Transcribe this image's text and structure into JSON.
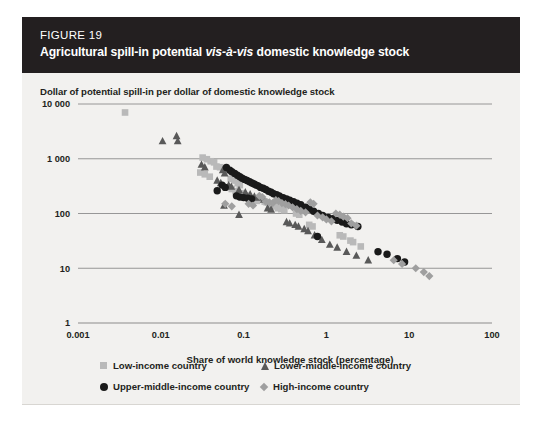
{
  "figure": {
    "number_label": "FIGURE 19",
    "title_part1": "Agricultural spill-in potential ",
    "title_italic": "vis-à-vis",
    "title_part2": " domestic knowledge stock",
    "title_full": "Agricultural spill-in potential vis-à-vis domestic knowledge stock"
  },
  "colors": {
    "header_background": "#231f20",
    "card_background": "#f2f1ef",
    "page_background": "#ffffff",
    "axis_line": "#8c8c8c",
    "gridline": "#8c8c8c",
    "text": "#231f20",
    "low_income": "#b9b9b9",
    "lower_middle_income": "#595959",
    "upper_middle_income": "#1a1a1a",
    "high_income": "#9f9f9f"
  },
  "legend": {
    "position": "below-plot",
    "items": [
      {
        "label": "Low-income country",
        "marker": "square",
        "color": "#b9b9b9",
        "icon": "square-marker-icon"
      },
      {
        "label": "Lower-middle-income country",
        "marker": "triangle",
        "color": "#595959",
        "icon": "triangle-marker-icon"
      },
      {
        "label": "Upper-middle-income country",
        "marker": "circle",
        "color": "#1a1a1a",
        "icon": "circle-marker-icon"
      },
      {
        "label": "High-income country",
        "marker": "diamond",
        "color": "#9f9f9f",
        "icon": "diamond-marker-icon"
      }
    ]
  },
  "chart_data": {
    "type": "scatter",
    "title": "Agricultural spill-in potential vis-à-vis domestic knowledge stock",
    "xlabel": "Share of world knowledge stock (percentage)",
    "ylabel": "Dollar of potential spill-in per dollar of domestic knowledge stock",
    "xscale": "log",
    "yscale": "log",
    "xlim": [
      0.001,
      100
    ],
    "ylim": [
      1,
      10000
    ],
    "xticks": [
      0.001,
      0.01,
      0.1,
      1,
      10,
      100
    ],
    "xticklabels": [
      "0.001",
      "0.01",
      "0.1",
      "1",
      "10",
      "100"
    ],
    "yticks": [
      1,
      10,
      100,
      1000,
      10000
    ],
    "yticklabels": [
      "1",
      "10",
      "100",
      "1 000",
      "10 000"
    ],
    "grid": "horizontal",
    "legend_position": "below",
    "series": [
      {
        "name": "Low-income country",
        "marker": "square",
        "color": "#b9b9b9",
        "points": [
          [
            0.0037,
            7000
          ],
          [
            0.032,
            1050
          ],
          [
            0.036,
            980
          ],
          [
            0.04,
            900
          ],
          [
            0.044,
            860
          ],
          [
            0.047,
            720
          ],
          [
            0.052,
            700
          ],
          [
            0.058,
            640
          ],
          [
            0.062,
            600
          ],
          [
            0.03,
            560
          ],
          [
            0.034,
            520
          ],
          [
            0.039,
            470
          ],
          [
            0.07,
            430
          ],
          [
            0.078,
            400
          ],
          [
            0.085,
            360
          ],
          [
            0.09,
            330
          ],
          [
            0.066,
            300
          ],
          [
            0.072,
            280
          ],
          [
            0.08,
            255
          ],
          [
            0.096,
            235
          ],
          [
            0.105,
            215
          ],
          [
            0.115,
            200
          ],
          [
            0.125,
            190
          ],
          [
            0.135,
            180
          ],
          [
            0.145,
            170
          ],
          [
            0.19,
            160
          ],
          [
            0.205,
            150
          ],
          [
            0.22,
            145
          ],
          [
            0.24,
            135
          ],
          [
            0.26,
            125
          ],
          [
            0.285,
            120
          ],
          [
            0.43,
            100
          ],
          [
            0.47,
            95
          ],
          [
            0.62,
            62
          ],
          [
            0.68,
            58
          ],
          [
            1.45,
            40
          ],
          [
            1.6,
            38
          ],
          [
            1.95,
            32
          ],
          [
            2.1,
            30
          ],
          [
            2.6,
            25
          ],
          [
            0.31,
            115
          ],
          [
            0.18,
            165
          ]
        ]
      },
      {
        "name": "Lower-middle-income country",
        "marker": "triangle",
        "color": "#595959",
        "points": [
          [
            0.0105,
            2100
          ],
          [
            0.0155,
            2600
          ],
          [
            0.016,
            2100
          ],
          [
            0.031,
            780
          ],
          [
            0.034,
            700
          ],
          [
            0.056,
            620
          ],
          [
            0.059,
            540
          ],
          [
            0.048,
            400
          ],
          [
            0.053,
            360
          ],
          [
            0.066,
            330
          ],
          [
            0.071,
            310
          ],
          [
            0.088,
            270
          ],
          [
            0.105,
            245
          ],
          [
            0.12,
            225
          ],
          [
            0.135,
            205
          ],
          [
            0.15,
            195
          ],
          [
            0.175,
            180
          ],
          [
            0.195,
            125
          ],
          [
            0.215,
            118
          ],
          [
            0.33,
            70
          ],
          [
            0.36,
            66
          ],
          [
            0.42,
            62
          ],
          [
            0.46,
            58
          ],
          [
            0.54,
            52
          ],
          [
            0.6,
            48
          ],
          [
            0.72,
            40
          ],
          [
            0.88,
            33
          ],
          [
            1.1,
            27
          ],
          [
            1.35,
            24
          ],
          [
            1.75,
            20
          ],
          [
            2.3,
            17
          ],
          [
            3.2,
            14
          ],
          [
            0.058,
            140
          ],
          [
            0.088,
            95
          ]
        ]
      },
      {
        "name": "Upper-middle-income country",
        "marker": "circle",
        "color": "#1a1a1a",
        "points": [
          [
            0.062,
            690
          ],
          [
            0.068,
            620
          ],
          [
            0.072,
            580
          ],
          [
            0.078,
            540
          ],
          [
            0.084,
            500
          ],
          [
            0.09,
            470
          ],
          [
            0.096,
            440
          ],
          [
            0.103,
            420
          ],
          [
            0.11,
            400
          ],
          [
            0.118,
            380
          ],
          [
            0.126,
            360
          ],
          [
            0.134,
            345
          ],
          [
            0.142,
            330
          ],
          [
            0.15,
            320
          ],
          [
            0.16,
            300
          ],
          [
            0.172,
            290
          ],
          [
            0.185,
            275
          ],
          [
            0.055,
            330
          ],
          [
            0.06,
            300
          ],
          [
            0.048,
            260
          ],
          [
            0.082,
            210
          ],
          [
            0.09,
            200
          ],
          [
            0.1,
            195
          ],
          [
            0.112,
            190
          ],
          [
            0.125,
            185
          ],
          [
            0.2,
            255
          ],
          [
            0.215,
            245
          ],
          [
            0.23,
            230
          ],
          [
            0.25,
            220
          ],
          [
            0.27,
            210
          ],
          [
            0.3,
            195
          ],
          [
            0.33,
            185
          ],
          [
            0.36,
            175
          ],
          [
            0.4,
            165
          ],
          [
            0.44,
            155
          ],
          [
            0.49,
            145
          ],
          [
            0.56,
            130
          ],
          [
            0.62,
            120
          ],
          [
            0.7,
            110
          ],
          [
            0.8,
            100
          ],
          [
            0.9,
            92
          ],
          [
            1.05,
            85
          ],
          [
            1.2,
            80
          ],
          [
            1.35,
            75
          ],
          [
            1.55,
            70
          ],
          [
            1.75,
            65
          ],
          [
            2.0,
            62
          ],
          [
            2.4,
            58
          ],
          [
            0.78,
            38
          ],
          [
            4.2,
            20
          ],
          [
            5.4,
            18
          ],
          [
            7.2,
            15
          ],
          [
            8.8,
            13
          ]
        ]
      },
      {
        "name": "High-income country",
        "marker": "diamond",
        "color": "#9f9f9f",
        "points": [
          [
            0.072,
            135
          ],
          [
            0.115,
            150
          ],
          [
            0.13,
            140
          ],
          [
            0.155,
            210
          ],
          [
            0.168,
            200
          ],
          [
            0.185,
            165
          ],
          [
            0.205,
            160
          ],
          [
            0.225,
            155
          ],
          [
            0.245,
            175
          ],
          [
            0.265,
            168
          ],
          [
            0.29,
            155
          ],
          [
            0.32,
            148
          ],
          [
            0.35,
            140
          ],
          [
            0.39,
            130
          ],
          [
            0.44,
            120
          ],
          [
            0.49,
            112
          ],
          [
            0.56,
            105
          ],
          [
            0.64,
            160
          ],
          [
            0.7,
            150
          ],
          [
            0.78,
            92
          ],
          [
            0.9,
            85
          ],
          [
            1.0,
            78
          ],
          [
            1.15,
            72
          ],
          [
            1.3,
            100
          ],
          [
            1.45,
            95
          ],
          [
            1.6,
            88
          ],
          [
            1.8,
            82
          ],
          [
            2.0,
            66
          ],
          [
            2.3,
            60
          ],
          [
            6.5,
            14
          ],
          [
            8.2,
            12
          ],
          [
            12.0,
            10
          ],
          [
            15.0,
            8.5
          ],
          [
            17.5,
            7.2
          ],
          [
            0.06,
            150
          ]
        ]
      }
    ]
  }
}
